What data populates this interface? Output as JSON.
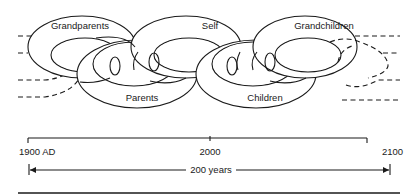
{
  "diagram": {
    "title": "",
    "links": [
      {
        "label": "Grandparents",
        "position": "upper",
        "order": 1
      },
      {
        "label": "Parents",
        "position": "lower",
        "order": 2
      },
      {
        "label": "Self",
        "position": "upper",
        "order": 3
      },
      {
        "label": "Children",
        "position": "lower",
        "order": 4
      },
      {
        "label": "Grandchildren",
        "position": "upper",
        "order": 5
      }
    ],
    "continuations": {
      "left": "dashed",
      "right": "dashed"
    }
  },
  "timeline": {
    "start_label": "1900 AD",
    "mid_label": "2000",
    "end_label": "2100",
    "span_label": "200 years"
  },
  "colors": {
    "ink": "#1a1a1a",
    "background": "#ffffff"
  }
}
